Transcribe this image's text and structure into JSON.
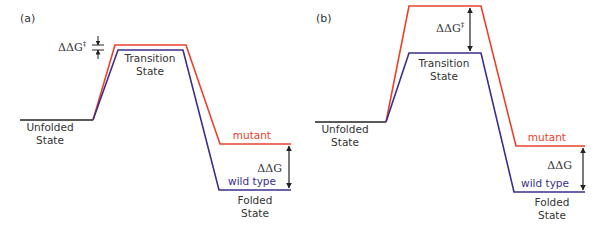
{
  "figure": {
    "colors": {
      "mutant": "#e8412c",
      "wild_type": "#3a2f8a",
      "baseline": "#222222",
      "arrow": "#222222",
      "text": "#333333"
    },
    "panels": [
      {
        "id": "a",
        "label": "(a)",
        "state_labels": {
          "unfolded_line1": "Unfolded",
          "unfolded_line2": "State",
          "transition_line1": "Transition",
          "transition_line2": "State",
          "folded_line1": "Folded",
          "folded_line2": "State"
        },
        "series_labels": {
          "mutant": "mutant",
          "wild_type": "wild type"
        },
        "annotations": {
          "ddg_ts": "ΔΔG",
          "ddg_ts_sup": "‡",
          "ddg": "ΔΔG"
        }
      },
      {
        "id": "b",
        "label": "(b)",
        "state_labels": {
          "unfolded_line1": "Unfolded",
          "unfolded_line2": "State",
          "transition_line1": "Transition",
          "transition_line2": "State",
          "folded_line1": "Folded",
          "folded_line2": "State"
        },
        "series_labels": {
          "mutant": "mutant",
          "wild_type": "wild type"
        },
        "annotations": {
          "ddg_ts": "ΔΔG",
          "ddg_ts_sup": "‡",
          "ddg": "ΔΔG"
        }
      }
    ]
  }
}
